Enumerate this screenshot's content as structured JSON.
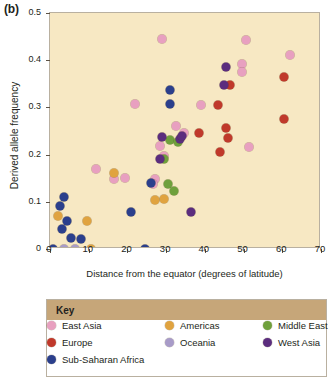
{
  "panel_label": "(b)",
  "chart_data": {
    "type": "scatter",
    "title": "",
    "xlabel": "Distance from the equator (degrees of latitude)",
    "ylabel": "Derived allele frequency",
    "xlim": [
      0,
      70
    ],
    "ylim": [
      0,
      0.5
    ],
    "xticks": [
      0,
      10,
      20,
      30,
      40,
      50,
      60,
      70
    ],
    "xtick_labels": [
      "0",
      "10",
      "20",
      "30",
      "40",
      "50",
      "60",
      "70"
    ],
    "yticks": [
      0,
      0.1,
      0.2,
      0.3,
      0.4,
      0.5
    ],
    "ytick_labels": [
      "0",
      "0.1",
      "0.2",
      "0.3",
      "0.4",
      "0.5"
    ],
    "grid": false,
    "legend_position": "below",
    "plot_background": "#f7e8c3",
    "series": [
      {
        "name": "East Asia",
        "color": "#e8a0c0",
        "points": [
          [
            29.0,
            0.444
          ],
          [
            50.5,
            0.443
          ],
          [
            62.0,
            0.411
          ],
          [
            49.5,
            0.393
          ],
          [
            49.5,
            0.374
          ],
          [
            22.0,
            0.307
          ],
          [
            39.0,
            0.305
          ],
          [
            32.5,
            0.261
          ],
          [
            34.5,
            0.246
          ],
          [
            28.5,
            0.218
          ],
          [
            51.5,
            0.217
          ],
          [
            29.5,
            0.198
          ],
          [
            12.0,
            0.17
          ],
          [
            19.5,
            0.15
          ],
          [
            27.0,
            0.149
          ],
          [
            26.5,
            0.137
          ],
          [
            16.5,
            0.148
          ]
        ]
      },
      {
        "name": "Europe",
        "color": "#c0392b",
        "points": [
          [
            60.5,
            0.365
          ],
          [
            46.5,
            0.347
          ],
          [
            43.5,
            0.305
          ],
          [
            60.5,
            0.276
          ],
          [
            45.5,
            0.256
          ],
          [
            38.5,
            0.246
          ],
          [
            46.0,
            0.236
          ],
          [
            44.0,
            0.205
          ]
        ]
      },
      {
        "name": "Sub-Saharan Africa",
        "color": "#2b3f8c",
        "points": [
          [
            3.5,
            0.111
          ],
          [
            2.5,
            0.091
          ],
          [
            4.5,
            0.06
          ],
          [
            3.0,
            0.042
          ],
          [
            5.5,
            0.023
          ],
          [
            8.0,
            0.022
          ],
          [
            0.8,
            0.0
          ],
          [
            24.5,
            0.0
          ],
          [
            21.0,
            0.078
          ],
          [
            26.0,
            0.14
          ],
          [
            31.0,
            0.336
          ],
          [
            31.0,
            0.307
          ]
        ]
      },
      {
        "name": "Americas",
        "color": "#e0a340",
        "points": [
          [
            2.0,
            0.069
          ],
          [
            9.5,
            0.06
          ],
          [
            10.5,
            0.0
          ],
          [
            16.5,
            0.161
          ],
          [
            29.5,
            0.105
          ],
          [
            27.0,
            0.104
          ]
        ]
      },
      {
        "name": "Oceania",
        "color": "#a89bc8",
        "points": [
          [
            3.5,
            0.0
          ],
          [
            6.5,
            0.0
          ]
        ]
      },
      {
        "name": "Middle East",
        "color": "#6fa03c",
        "points": [
          [
            31.0,
            0.231
          ],
          [
            29.5,
            0.19
          ],
          [
            30.5,
            0.137
          ],
          [
            32.0,
            0.122
          ],
          [
            33.0,
            0.226
          ]
        ]
      },
      {
        "name": "West Asia",
        "color": "#5b2d7e",
        "points": [
          [
            45.5,
            0.386
          ],
          [
            45.0,
            0.347
          ],
          [
            29.0,
            0.237
          ],
          [
            33.5,
            0.232
          ],
          [
            28.5,
            0.19
          ],
          [
            36.5,
            0.078
          ],
          [
            34.0,
            0.24
          ]
        ]
      }
    ]
  },
  "legend": {
    "title": "Key",
    "items": [
      {
        "label": "East Asia",
        "color": "#e8a0c0"
      },
      {
        "label": "Europe",
        "color": "#c0392b"
      },
      {
        "label": "Sub-Saharan Africa",
        "color": "#2b3f8c"
      },
      {
        "label": "Americas",
        "color": "#e0a340"
      },
      {
        "label": "Oceania",
        "color": "#a89bc8"
      },
      {
        "label": "Middle East",
        "color": "#6fa03c"
      },
      {
        "label": "West Asia",
        "color": "#5b2d7e"
      }
    ]
  }
}
